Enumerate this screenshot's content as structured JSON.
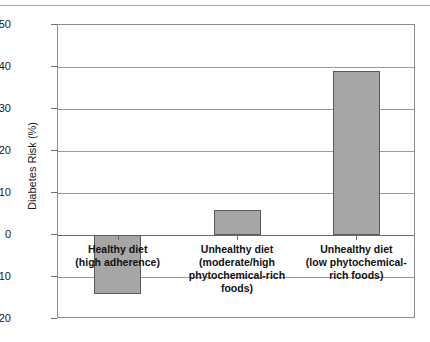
{
  "chart_data": {
    "type": "bar",
    "title": "",
    "xlabel": "",
    "ylabel": "Diabetes Risk (%)",
    "categories": [
      "Healthy diet\n(high adherence)",
      "Unhealthy diet\n(moderate/high\nphytochemical-rich\nfoods)",
      "Unhealthy diet\n(low phytochemical-\nrich foods)"
    ],
    "values": [
      -14,
      6,
      39
    ],
    "ylim": [
      -20,
      50
    ],
    "yticks": [
      50,
      40,
      30,
      20,
      10,
      0,
      -10,
      -20
    ],
    "ytick_labels": [
      "50",
      "40",
      "30",
      "20",
      "10",
      "0",
      "−10",
      "−20"
    ],
    "grid": true,
    "legend": false,
    "bar_color": "#a6a6a6",
    "bar_edge_color": "#5a5a5a",
    "axis_color": "#8c8c8c",
    "grid_color": "#9a9a9a"
  }
}
